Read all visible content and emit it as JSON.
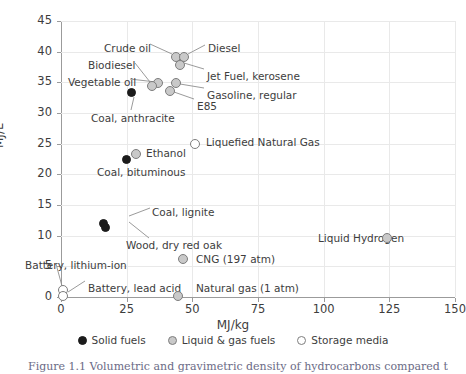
{
  "chart_data": {
    "type": "scatter",
    "title": "",
    "xlabel": "MJ/kg",
    "ylabel": "MJ/L",
    "xlim": [
      0,
      150
    ],
    "ylim": [
      0,
      45
    ],
    "xticks": [
      0,
      25,
      50,
      75,
      100,
      125,
      150
    ],
    "yticks": [
      0,
      5,
      10,
      15,
      20,
      25,
      30,
      35,
      40,
      45
    ],
    "grid": true,
    "legend_position": "bottom-center",
    "legend": [
      {
        "label": "Solid fuels",
        "marker": "solid"
      },
      {
        "label": "Liquid & gas fuels",
        "marker": "liquid"
      },
      {
        "label": "Storage media",
        "marker": "storage"
      }
    ],
    "points": [
      {
        "label": "Crude oil",
        "x": 43.7,
        "y": 39.1,
        "category": "liquid"
      },
      {
        "label": "Diesel",
        "x": 46.8,
        "y": 39.1,
        "category": "liquid"
      },
      {
        "label": "Jet Fuel, kerosene",
        "x": 45.2,
        "y": 37.8,
        "category": "liquid"
      },
      {
        "label": "Vegetable oil",
        "x": 36.9,
        "y": 34.9,
        "category": "liquid"
      },
      {
        "label": "Biodiesel",
        "x": 34.6,
        "y": 34.4,
        "category": "liquid"
      },
      {
        "label": "Gasoline, regular",
        "x": 43.7,
        "y": 34.9,
        "category": "liquid"
      },
      {
        "label": "E85",
        "x": 41.4,
        "y": 33.6,
        "category": "liquid"
      },
      {
        "label": "Coal, anthracite",
        "x": 27.0,
        "y": 33.3,
        "category": "solid"
      },
      {
        "label": "Liquefied Natural Gas",
        "x": 51.0,
        "y": 25.0,
        "category": "storage"
      },
      {
        "label": "Ethanol",
        "x": 28.5,
        "y": 23.3,
        "category": "liquid"
      },
      {
        "label": "Coal, bituminous",
        "x": 25.0,
        "y": 22.5,
        "category": "solid"
      },
      {
        "label": "Coal, lignite",
        "x": 16.0,
        "y": 12.0,
        "category": "solid"
      },
      {
        "label": "Wood, dry red oak",
        "x": 17.0,
        "y": 11.4,
        "category": "solid"
      },
      {
        "label": "CNG (197 atm)",
        "x": 46.5,
        "y": 6.2,
        "category": "liquid"
      },
      {
        "label": "Liquid Hydrogen",
        "x": 124.0,
        "y": 9.6,
        "category": "liquid"
      },
      {
        "label": "Battery, lithium-ion",
        "x": 0.8,
        "y": 1.1,
        "category": "storage"
      },
      {
        "label": "Battery, lead acid",
        "x": 0.8,
        "y": 0.2,
        "category": "storage"
      },
      {
        "label": "Natural gas (1 atm)",
        "x": 44.5,
        "y": 0.1,
        "category": "liquid"
      }
    ]
  },
  "annotations": [
    {
      "text": "Crude oil",
      "x": 104,
      "y": 43,
      "align": "left"
    },
    {
      "text": "Diesel",
      "x": 208,
      "y": 43,
      "align": "left"
    },
    {
      "text": "Biodiesel",
      "x": 88,
      "y": 60,
      "align": "left"
    },
    {
      "text": "Jet Fuel, kerosene",
      "x": 207,
      "y": 71,
      "align": "left"
    },
    {
      "text": "Vegetable oil",
      "x": 68,
      "y": 77,
      "align": "left"
    },
    {
      "text": "Gasoline, regular",
      "x": 207,
      "y": 90,
      "align": "left"
    },
    {
      "text": "E85",
      "x": 197,
      "y": 101,
      "align": "left"
    },
    {
      "text": "Coal, anthracite",
      "x": 91,
      "y": 113,
      "align": "left"
    },
    {
      "text": "Liquefied Natural Gas",
      "x": 206,
      "y": 137,
      "align": "left"
    },
    {
      "text": "Ethanol",
      "x": 146,
      "y": 148,
      "align": "left"
    },
    {
      "text": "Coal, bituminous",
      "x": 97,
      "y": 167,
      "align": "left"
    },
    {
      "text": "Coal, lignite",
      "x": 152,
      "y": 207,
      "align": "left"
    },
    {
      "text": "Wood, dry red oak",
      "x": 126,
      "y": 240,
      "align": "left"
    },
    {
      "text": "Liquid Hydrogen",
      "x": 318,
      "y": 233,
      "align": "left"
    },
    {
      "text": "CNG (197 atm)",
      "x": 196,
      "y": 254,
      "align": "left"
    },
    {
      "text": "Battery, lithium-ion",
      "x": 25,
      "y": 260,
      "align": "left"
    },
    {
      "text": "Battery, lead acid",
      "x": 88,
      "y": 283,
      "align": "left"
    },
    {
      "text": "Natural gas (1 atm)",
      "x": 196,
      "y": 283,
      "align": "left"
    }
  ],
  "leaders": [
    {
      "x1": 150,
      "y1": 44,
      "x2": 172,
      "y2": 54
    },
    {
      "x1": 205,
      "y1": 45,
      "x2": 188,
      "y2": 54
    },
    {
      "x1": 135,
      "y1": 63,
      "x2": 150,
      "y2": 82
    },
    {
      "x1": 204,
      "y1": 69,
      "x2": 184,
      "y2": 63
    },
    {
      "x1": 130,
      "y1": 79,
      "x2": 156,
      "y2": 82
    },
    {
      "x1": 204,
      "y1": 88,
      "x2": 180,
      "y2": 84
    },
    {
      "x1": 194,
      "y1": 99,
      "x2": 174,
      "y2": 92
    },
    {
      "x1": 131,
      "y1": 110,
      "x2": 134,
      "y2": 97
    },
    {
      "x1": 150,
      "y1": 208,
      "x2": 129,
      "y2": 216
    },
    {
      "x1": 149,
      "y1": 238,
      "x2": 129,
      "y2": 222
    },
    {
      "x1": 85,
      "y1": 281,
      "x2": 68,
      "y2": 292
    },
    {
      "x1": 56,
      "y1": 264,
      "x2": 62,
      "y2": 286
    }
  ],
  "caption": {
    "text": "Figure 1.1 Volumetric and gravimetric density of hydrocarbons compared to ..."
  },
  "colors": {
    "solid_fuel": "#1b1b1b",
    "liquid_gas_fuel": "#c9c9c9",
    "storage_media": "#ffffff",
    "marker_stroke": "#7d7d7d",
    "grid": "#e9e9e9",
    "axis": "#9b9b9b",
    "text": "#3d3d3d"
  }
}
